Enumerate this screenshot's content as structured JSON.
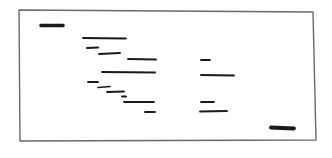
{
  "diagram": {
    "type": "hand-drawn layout sketch",
    "background": "#ffffff",
    "ink_color": "#1a1a1a",
    "frame": {
      "color": "#6a6a6a",
      "points": [
        [
          19,
          10
        ],
        [
          313,
          12
        ],
        [
          316,
          140
        ],
        [
          20,
          141
        ]
      ]
    },
    "marks": [
      {
        "id": "top-left-block",
        "x1": 41,
        "y1": 25.5,
        "x2": 63,
        "y2": 25.5,
        "weight": 3.6
      },
      {
        "id": "line-a",
        "x1": 83,
        "y1": 38,
        "x2": 126,
        "y2": 38.5,
        "weight": 1.8
      },
      {
        "id": "line-b",
        "x1": 87,
        "y1": 48,
        "x2": 98,
        "y2": 47.5,
        "weight": 2.0
      },
      {
        "id": "line-c",
        "x1": 99,
        "y1": 54,
        "x2": 120,
        "y2": 53,
        "weight": 1.8
      },
      {
        "id": "line-d",
        "x1": 128,
        "y1": 59,
        "x2": 156,
        "y2": 59.5,
        "weight": 1.8
      },
      {
        "id": "line-e",
        "x1": 102,
        "y1": 72,
        "x2": 155,
        "y2": 72.5,
        "weight": 2.0
      },
      {
        "id": "line-f",
        "x1": 88,
        "y1": 82,
        "x2": 98,
        "y2": 82,
        "weight": 1.8
      },
      {
        "id": "line-g",
        "x1": 98,
        "y1": 87.5,
        "x2": 110,
        "y2": 86.5,
        "weight": 1.6
      },
      {
        "id": "line-h",
        "x1": 107,
        "y1": 92,
        "x2": 124,
        "y2": 91.5,
        "weight": 1.8
      },
      {
        "id": "line-i",
        "x1": 122,
        "y1": 96.5,
        "x2": 126,
        "y2": 96.5,
        "weight": 2.0
      },
      {
        "id": "line-j",
        "x1": 124,
        "y1": 102,
        "x2": 154,
        "y2": 102,
        "weight": 1.8
      },
      {
        "id": "line-k",
        "x1": 145,
        "y1": 112,
        "x2": 155,
        "y2": 112,
        "weight": 1.8
      },
      {
        "id": "line-l",
        "x1": 201,
        "y1": 60,
        "x2": 210,
        "y2": 60,
        "weight": 1.8
      },
      {
        "id": "line-m",
        "x1": 201,
        "y1": 75,
        "x2": 234,
        "y2": 75.5,
        "weight": 1.8
      },
      {
        "id": "line-n",
        "x1": 201,
        "y1": 102,
        "x2": 214,
        "y2": 102,
        "weight": 1.8
      },
      {
        "id": "line-o",
        "x1": 200,
        "y1": 111.5,
        "x2": 227,
        "y2": 111,
        "weight": 1.8
      },
      {
        "id": "bottom-right-block",
        "x1": 271,
        "y1": 127.5,
        "x2": 294,
        "y2": 128.5,
        "weight": 3.8
      }
    ]
  }
}
